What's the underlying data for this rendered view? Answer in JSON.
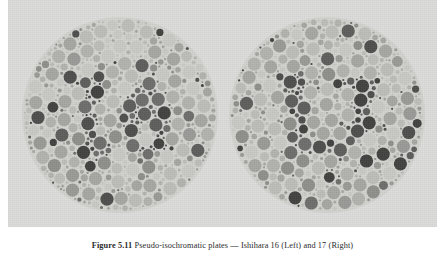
{
  "figure": {
    "caption_label": "Figure 5.11",
    "caption_text": "Pseudo-isochromatic plates — Ishihara 16 (Left) and 17 (Right)",
    "panel_background": "#dcdcda",
    "plate_background": "#d2d2cf"
  },
  "plates": [
    {
      "id": "plate-left",
      "name": "ishihara-plate-left",
      "hidden_figure": "16",
      "cx": 98,
      "cy": 98,
      "radius": 97
    },
    {
      "id": "plate-right",
      "name": "ishihara-plate-right",
      "hidden_figure": "17",
      "cx": 98,
      "cy": 98,
      "radius": 97
    }
  ],
  "dot_palette": {
    "background_dots": [
      "#c9c9c6",
      "#bdbdba",
      "#b2b2ae",
      "#a6a6a2"
    ],
    "figure_dots": [
      "#6e6e6c",
      "#5e5e5c",
      "#4f4f4d",
      "#424240"
    ],
    "mid_dots": [
      "#8f8f8c",
      "#9a9a97"
    ]
  }
}
